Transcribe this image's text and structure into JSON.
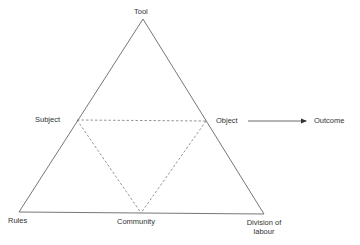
{
  "diagram": {
    "type": "activity-system-triangle",
    "nodes": {
      "tool": "Tool",
      "subject": "Subject",
      "object": "Object",
      "outcome": "Outcome",
      "rules": "Rules",
      "community": "Community",
      "division_line1": "Division of",
      "division_line2": "labour"
    },
    "edges": [
      {
        "from": "Tool",
        "to": "Rules",
        "style": "solid"
      },
      {
        "from": "Tool",
        "to": "Division of labour",
        "style": "solid"
      },
      {
        "from": "Rules",
        "to": "Division of labour",
        "style": "solid"
      },
      {
        "from": "Subject",
        "to": "Object",
        "style": "dashed"
      },
      {
        "from": "Subject",
        "to": "Community",
        "style": "dashed"
      },
      {
        "from": "Object",
        "to": "Community",
        "style": "dashed"
      },
      {
        "from": "Object",
        "to": "Outcome",
        "style": "arrow"
      }
    ],
    "colors": {
      "line": "#555555",
      "text": "#333333",
      "background": "#ffffff"
    }
  }
}
